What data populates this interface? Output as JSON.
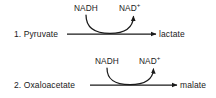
{
  "diagram": {
    "type": "biochemical-reaction-scheme",
    "stroke_color": "#1a1a1a",
    "text_color": "#1a1a1a",
    "background_color": "#ffffff",
    "reactions": [
      {
        "number_label": "1.",
        "substrate": "1. Pyruvate",
        "product": "lactate",
        "cofactor_in": "NADH",
        "cofactor_out_base": "NAD",
        "cofactor_out_sup": "+",
        "cofactor_out_full": "NAD+"
      },
      {
        "number_label": "2.",
        "substrate": "2. Oxaloacetate",
        "product": "malate",
        "cofactor_in": "NADH",
        "cofactor_out_base": "NAD",
        "cofactor_out_sup": "+",
        "cofactor_out_full": "NAD+"
      }
    ]
  }
}
